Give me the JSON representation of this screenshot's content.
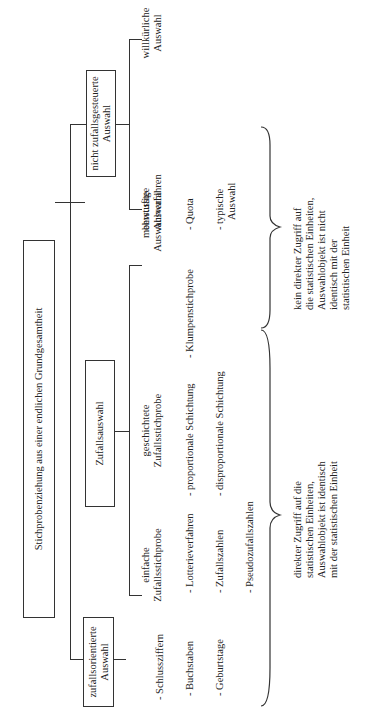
{
  "root": {
    "label": "Stichprobenziehung aus einer endlichen Grundgesamtheit"
  },
  "branches": [
    {
      "label": "zufallsorientierte Auswahl",
      "items": [
        "- Schlussziffern",
        "- Buchstaben",
        "- Geburtstage"
      ]
    },
    {
      "label": "Zufallsauswahl",
      "children": [
        {
          "label": "einfache Zufallsstichprobe",
          "items": [
            "- Lotterieverfahren",
            "- Zufallszahlen",
            "- Pseudozufallszahlen"
          ]
        },
        {
          "label": "geschichtete Zufallsstichprobe",
          "items": [
            "- proportionale Schichtung",
            "- disproportionale Schichtung"
          ]
        },
        {
          "label": "mehrstufige Auswahlverfahren",
          "items": [
            "- Klumpenstichprobe"
          ]
        }
      ]
    },
    {
      "label": "nicht zufallsgesteuerte Auswahl",
      "children": [
        {
          "label": "bewusste Auswahl",
          "items": [
            "- Quota",
            "- typische Auswahl"
          ]
        },
        {
          "label": "willkürliche Auswahl",
          "items": []
        }
      ]
    }
  ],
  "notes": {
    "direct": "direkter Zugriff auf die statistischen Einheiten, Auswahlobjekt ist identisch mit der statistischen Einheit",
    "indirect": "kein direkter Zugriff auf die statistischen Einheiten, Auswahlobjekt ist nicht identisch mit der statistischen Einheit"
  },
  "labels": {
    "b0": "zufallsorientierte",
    "b0b": "Auswahl",
    "b2": "nicht zufallsgesteuerte",
    "b2b": "Auswahl",
    "c0a": "einfache",
    "c0b": "Zufallsstichprobe",
    "c1a": "geschichtete",
    "c1b": "Zufallsstichprobe",
    "c2a": "mehrstufige",
    "c2b": "Auswahlverfahren",
    "c3a": "bewusste",
    "c3b": "Auswahl",
    "c4a": "willkürliche",
    "c4b": "Auswahl",
    "typ_a": "- typische",
    "typ_b": "Auswahl",
    "n1": [
      "direkter Zugriff auf die",
      "statistischen Einheiten,",
      "Auswahlobjekt ist identisch",
      "mit der statistischen Einheit"
    ],
    "n2": [
      "kein direkter Zugriff auf",
      "die statistischen Einheiten,",
      "Auswahlobjekt ist nicht",
      "identisch mit der",
      "statistischen Einheit"
    ]
  }
}
